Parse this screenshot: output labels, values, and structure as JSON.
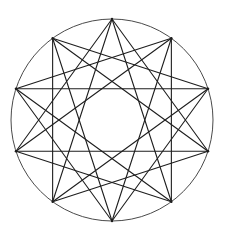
{
  "figure": {
    "point_count": 10,
    "star_steps": [
      3,
      4
    ],
    "colors": {
      "background": "#ffffff",
      "circle": "#4a4a4a",
      "chords": "#1e1e1e"
    }
  }
}
